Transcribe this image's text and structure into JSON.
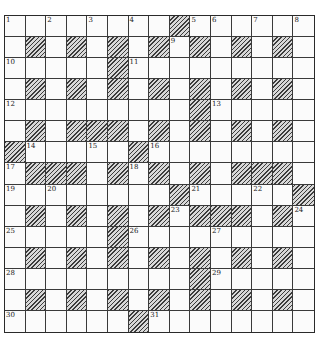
{
  "puzzle": {
    "rows": 15,
    "cols": 15,
    "block_color": "#3c3c3c",
    "grid": [
      "........#......",
      ".#.#.#.#.#.#.#.",
      ".....#.........",
      ".#.#.#.#.#.#.#.",
      ".........#.....",
      ".#.###.#.#.#.#.",
      "#.....#........",
      ".###.#.#.#.###.",
      "........#.....#",
      ".#.#.#.#.###.#.",
      ".....#.........",
      ".#.#.#.#.#.#.#.",
      ".........#.....",
      ".#.#.#.#.#.#.#.",
      "......#........"
    ],
    "numbers": [
      {
        "n": "1",
        "r": 0,
        "c": 0
      },
      {
        "n": "2",
        "r": 0,
        "c": 2
      },
      {
        "n": "3",
        "r": 0,
        "c": 4
      },
      {
        "n": "4",
        "r": 0,
        "c": 6
      },
      {
        "n": "5",
        "r": 0,
        "c": 9
      },
      {
        "n": "6",
        "r": 0,
        "c": 10
      },
      {
        "n": "7",
        "r": 0,
        "c": 12
      },
      {
        "n": "8",
        "r": 0,
        "c": 14
      },
      {
        "n": "9",
        "r": 1,
        "c": 8
      },
      {
        "n": "10",
        "r": 2,
        "c": 0
      },
      {
        "n": "11",
        "r": 2,
        "c": 6
      },
      {
        "n": "12",
        "r": 4,
        "c": 0
      },
      {
        "n": "13",
        "r": 4,
        "c": 10
      },
      {
        "n": "14",
        "r": 6,
        "c": 1
      },
      {
        "n": "15",
        "r": 6,
        "c": 4
      },
      {
        "n": "16",
        "r": 6,
        "c": 7
      },
      {
        "n": "17",
        "r": 7,
        "c": 0
      },
      {
        "n": "18",
        "r": 7,
        "c": 6
      },
      {
        "n": "19",
        "r": 8,
        "c": 0
      },
      {
        "n": "20",
        "r": 8,
        "c": 2
      },
      {
        "n": "21",
        "r": 8,
        "c": 9
      },
      {
        "n": "22",
        "r": 8,
        "c": 12
      },
      {
        "n": "23",
        "r": 9,
        "c": 8
      },
      {
        "n": "24",
        "r": 9,
        "c": 14
      },
      {
        "n": "25",
        "r": 10,
        "c": 0
      },
      {
        "n": "26",
        "r": 10,
        "c": 6
      },
      {
        "n": "27",
        "r": 10,
        "c": 10
      },
      {
        "n": "28",
        "r": 12,
        "c": 0
      },
      {
        "n": "29",
        "r": 12,
        "c": 10
      },
      {
        "n": "30",
        "r": 14,
        "c": 0
      },
      {
        "n": "31",
        "r": 14,
        "c": 7
      }
    ]
  }
}
